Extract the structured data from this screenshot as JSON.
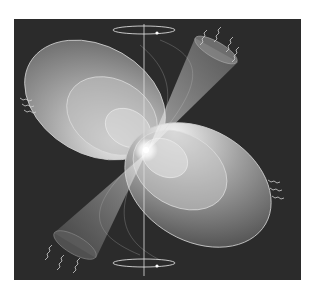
{
  "figure": {
    "style": "grayscale illustration",
    "background_color": "#2b2b2b",
    "page_color": "#ffffff",
    "elements": {
      "rotation_axis": "vertical line",
      "rotation_rings": [
        "top",
        "bottom"
      ],
      "magnetic_field_lobes": [
        "upper-left",
        "lower-right"
      ],
      "radiation_beams": [
        "upper-right",
        "lower-left"
      ],
      "emission_waves": [
        "upper-right",
        "lower-left",
        "left",
        "right"
      ]
    }
  }
}
